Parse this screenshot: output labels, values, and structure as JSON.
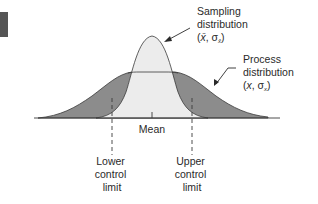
{
  "diagram": {
    "type": "control-chart-distributions",
    "labels": {
      "sampling": {
        "line1": "Sampling",
        "line2": "distribution",
        "line3_open": "(",
        "line3_var": "x̄",
        "line3_sep": ", σ",
        "line3_sub": "x̄",
        "line3_close": ")"
      },
      "process": {
        "line1": "Process",
        "line2": "distribution",
        "line3_open": "(",
        "line3_var": "x",
        "line3_sep": ", σ",
        "line3_sub": "x",
        "line3_close": ")"
      },
      "mean": "Mean",
      "lower_limit": {
        "line1": "Lower",
        "line2": "control",
        "line3": "limit"
      },
      "upper_limit": {
        "line1": "Upper",
        "line2": "control",
        "line3": "limit"
      }
    },
    "colors": {
      "process_fill": "#8c8c8c",
      "sampling_fill": "#ececec",
      "outline": "#3a3a3a",
      "corner_block": "#555555",
      "text": "#2a2a2a"
    }
  }
}
